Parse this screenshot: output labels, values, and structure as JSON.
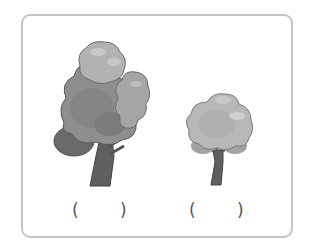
{
  "worksheet": {
    "items": [
      {
        "name": "tall-tree",
        "label": "tall tree",
        "answer_open": "(",
        "answer_close": ")",
        "answer_value": ""
      },
      {
        "name": "short-tree",
        "label": "short tree",
        "answer_open": "(",
        "answer_close": ")",
        "answer_value": ""
      }
    ]
  },
  "colors": {
    "frame_border": "#c4c4c4",
    "foliage_light": "#b5b5b5",
    "foliage_mid": "#9a9a9a",
    "foliage_dark": "#6e6e6e",
    "trunk": "#5f5f5f",
    "outline": "#555555"
  }
}
